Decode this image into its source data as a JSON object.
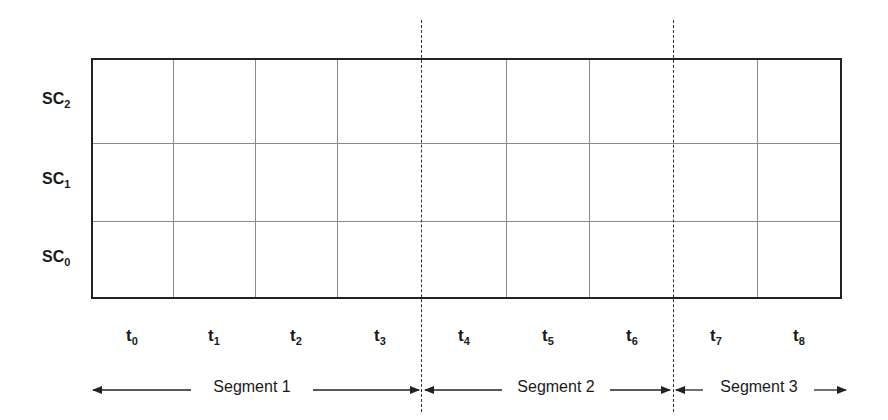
{
  "diagram": {
    "rows": [
      {
        "label": "SC",
        "sub": "2"
      },
      {
        "label": "SC",
        "sub": "1"
      },
      {
        "label": "SC",
        "sub": "0"
      }
    ],
    "time_slots": [
      {
        "label": "t",
        "sub": "0"
      },
      {
        "label": "t",
        "sub": "1"
      },
      {
        "label": "t",
        "sub": "2"
      },
      {
        "label": "t",
        "sub": "3"
      },
      {
        "label": "t",
        "sub": "4"
      },
      {
        "label": "t",
        "sub": "5"
      },
      {
        "label": "t",
        "sub": "6"
      },
      {
        "label": "t",
        "sub": "7"
      },
      {
        "label": "t",
        "sub": "8"
      }
    ],
    "segments": [
      {
        "label": "Segment 1",
        "slots": "t0-t3"
      },
      {
        "label": "Segment 2",
        "slots": "t4-t6"
      },
      {
        "label": "Segment 3",
        "slots": "t7-t8"
      }
    ],
    "colors": {
      "grid_border": "#222222",
      "grid_lines": "#8a8a8a",
      "dashed_dividers": "#333333"
    }
  }
}
